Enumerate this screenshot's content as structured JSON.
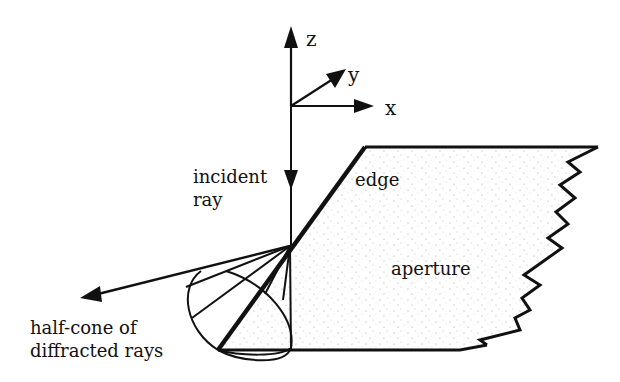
{
  "diagram": {
    "axes": {
      "z_label": "z",
      "y_label": "y",
      "x_label": "x"
    },
    "labels": {
      "incident_ray_line1": "incident",
      "incident_ray_line2": "ray",
      "edge": "edge",
      "aperture": "aperture",
      "half_cone_line1": "half-cone of",
      "half_cone_line2": "diffracted rays"
    },
    "colors": {
      "ink": "#111111",
      "background": "#ffffff",
      "stipple": "#9a9a9a"
    }
  }
}
